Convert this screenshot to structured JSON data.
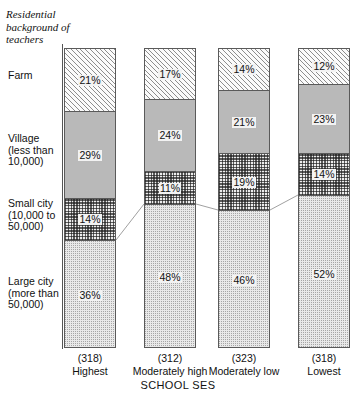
{
  "chart_data": {
    "type": "bar",
    "subtype": "stacked-percentage-column",
    "title": "Residential background of teachers",
    "xlabel": "SCHOOL SES",
    "ylabel": "",
    "ylim": [
      0,
      100
    ],
    "grid": false,
    "legend_position": "left-axis-category-labels",
    "categories": [
      "Highest",
      "Moderately high",
      "Moderately low",
      "Lowest"
    ],
    "category_counts": [
      "(318)",
      "(312)",
      "(323)",
      "(318)"
    ],
    "series": [
      {
        "name": "Farm",
        "values": [
          21,
          17,
          14,
          12
        ],
        "labels": [
          "21%",
          "17%",
          "14%",
          "12%"
        ],
        "fill": "diagonal-hatch"
      },
      {
        "name": "Village (less than 10,000)",
        "values": [
          29,
          24,
          21,
          23
        ],
        "labels": [
          "29%",
          "24%",
          "21%",
          "23%"
        ],
        "fill": "solid-gray"
      },
      {
        "name": "Small city (10,000 to 50,000)",
        "values": [
          14,
          11,
          19,
          14
        ],
        "labels": [
          "14%",
          "11%",
          "19%",
          "14%"
        ],
        "fill": "checkerboard"
      },
      {
        "name": "Large city (more than 50,000)",
        "values": [
          36,
          48,
          46,
          52
        ],
        "labels": [
          "36%",
          "48%",
          "46%",
          "52%"
        ],
        "fill": "fine-dotted"
      }
    ]
  },
  "axis_labels": {
    "farm": "Farm",
    "village": "Village\n(less than\n10,000)",
    "village_line1": "Village",
    "village_line2": "(less than",
    "village_line3": "10,000)",
    "small_city_line1": "Small city",
    "small_city_line2": "(10,000 to",
    "small_city_line3": "50,000)",
    "large_city_line1": "Large city",
    "large_city_line2": "(more than",
    "large_city_line3": "50,000)"
  },
  "colors": {
    "outline": "#5a5a5a",
    "village_fill": "#b9b9b9",
    "hatch": "#8d8d8d",
    "text": "#111111",
    "background": "#ffffff"
  }
}
